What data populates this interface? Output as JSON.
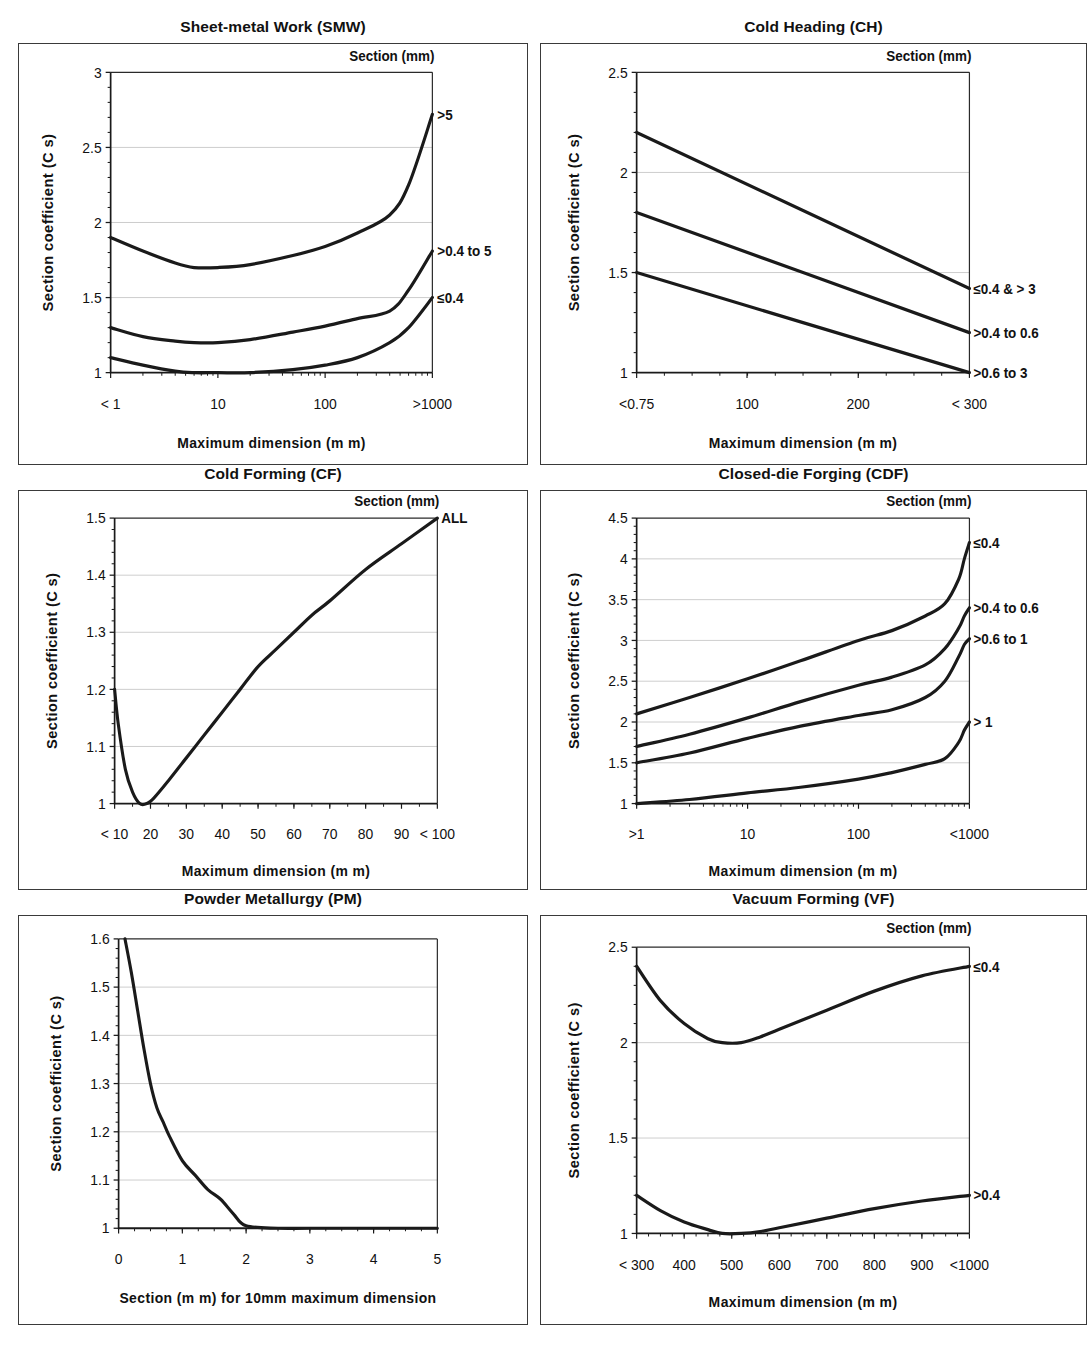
{
  "figure": {
    "panel_count": 6,
    "shared": {
      "ylabel": "Section coefficient (C s)",
      "xlabel_dimension": "Maximum dimension (m m)",
      "legend_heading": "Section (mm)"
    }
  },
  "chart_data": [
    {
      "id": "smw",
      "type": "line",
      "title": "Sheet-metal Work (SMW)",
      "xlabel": "Maximum dimension (m m)",
      "ylabel": "Section coefficient (C s)",
      "legend_title": "Section (mm)",
      "legend_position": "right-outside",
      "xscale": "log",
      "xlim": [
        1,
        1000
      ],
      "ylim": [
        1,
        3
      ],
      "yticks": [
        1,
        1.5,
        2,
        2.5,
        3
      ],
      "ytick_labels": [
        "1",
        "1.5",
        "2",
        "2.5",
        "3"
      ],
      "xticks": [
        1,
        10,
        100,
        1000
      ],
      "xtick_labels": [
        "< 1",
        "10",
        "100",
        ">1000"
      ],
      "grid": true,
      "series": [
        {
          "name": ">5",
          "x": [
            1,
            2,
            4,
            6,
            10,
            20,
            50,
            100,
            200,
            400,
            600,
            1000
          ],
          "values": [
            1.9,
            1.81,
            1.73,
            1.7,
            1.7,
            1.72,
            1.78,
            1.84,
            1.93,
            2.05,
            2.25,
            2.72
          ]
        },
        {
          "name": ">0.4 to 5",
          "x": [
            1,
            2,
            4,
            6,
            10,
            20,
            50,
            100,
            200,
            400,
            600,
            1000
          ],
          "values": [
            1.3,
            1.24,
            1.21,
            1.2,
            1.2,
            1.22,
            1.27,
            1.31,
            1.36,
            1.41,
            1.55,
            1.81
          ]
        },
        {
          "name": "≤0.4",
          "x": [
            1,
            2,
            4,
            6,
            10,
            20,
            50,
            100,
            200,
            400,
            600,
            1000
          ],
          "values": [
            1.1,
            1.05,
            1.01,
            1.0,
            1.0,
            1.0,
            1.02,
            1.05,
            1.1,
            1.2,
            1.3,
            1.5
          ]
        }
      ]
    },
    {
      "id": "ch",
      "type": "line",
      "title": "Cold Heading (CH)",
      "xlabel": "Maximum dimension (m m)",
      "ylabel": "Section coefficient (C s)",
      "legend_title": "Section (mm)",
      "legend_position": "right-outside",
      "xscale": "linear",
      "xlim": [
        0.75,
        300
      ],
      "ylim": [
        1,
        2.5
      ],
      "yticks": [
        1,
        1.5,
        2,
        2.5
      ],
      "ytick_labels": [
        "1",
        "1.5",
        "2",
        "2.5"
      ],
      "xticks": [
        0.75,
        100,
        200,
        300
      ],
      "xtick_labels": [
        "<0.75",
        "100",
        "200",
        "< 300"
      ],
      "grid": true,
      "series": [
        {
          "name": "≤0.4 & > 3",
          "x": [
            0.75,
            300
          ],
          "values": [
            2.2,
            1.42
          ]
        },
        {
          "name": ">0.4 to 0.6",
          "x": [
            0.75,
            300
          ],
          "values": [
            1.8,
            1.2
          ]
        },
        {
          "name": ">0.6 to 3",
          "x": [
            0.75,
            300
          ],
          "values": [
            1.5,
            1.0
          ]
        }
      ]
    },
    {
      "id": "cf",
      "type": "line",
      "title": "Cold Forming (CF)",
      "xlabel": "Maximum dimension (m m)",
      "ylabel": "Section coefficient (C s)",
      "legend_title": "Section (mm)",
      "legend_position": "right-outside",
      "xscale": "linear",
      "xlim": [
        10,
        100
      ],
      "ylim": [
        1,
        1.5
      ],
      "yticks": [
        1,
        1.1,
        1.2,
        1.3,
        1.4,
        1.5
      ],
      "ytick_labels": [
        "1",
        "1.1",
        "1.2",
        "1.3",
        "1.4",
        "1.5"
      ],
      "xticks": [
        10,
        20,
        30,
        40,
        50,
        60,
        70,
        80,
        90,
        100
      ],
      "xtick_labels": [
        "< 10",
        "20",
        "30",
        "40",
        "50",
        "60",
        "70",
        "80",
        "90",
        "< 100"
      ],
      "grid": true,
      "series": [
        {
          "name": "ALL",
          "x": [
            10,
            11,
            13,
            15,
            17,
            19,
            21,
            25,
            30,
            35,
            40,
            45,
            50,
            55,
            60,
            65,
            70,
            80,
            90,
            100
          ],
          "values": [
            1.2,
            1.14,
            1.06,
            1.02,
            1.0,
            1.0,
            1.01,
            1.04,
            1.08,
            1.12,
            1.16,
            1.2,
            1.24,
            1.27,
            1.3,
            1.33,
            1.355,
            1.41,
            1.455,
            1.5
          ]
        }
      ]
    },
    {
      "id": "cdf",
      "type": "line",
      "title": "Closed-die Forging (CDF)",
      "xlabel": "Maximum dimension (m m)",
      "ylabel": "Section coefficient (C s)",
      "legend_title": "Section (mm)",
      "legend_position": "right-outside",
      "xscale": "log",
      "xlim": [
        1,
        1000
      ],
      "ylim": [
        1,
        4.5
      ],
      "yticks": [
        1,
        1.5,
        2,
        2.5,
        3,
        3.5,
        4,
        4.5
      ],
      "ytick_labels": [
        "1",
        "1.5",
        "2",
        "2.5",
        "3",
        "3.5",
        "4",
        "4.5"
      ],
      "xticks": [
        1,
        10,
        100,
        1000
      ],
      "xtick_labels": [
        ">1",
        "10",
        "100",
        "<1000"
      ],
      "grid": true,
      "series": [
        {
          "name": "≤0.4",
          "x": [
            1,
            3,
            10,
            30,
            100,
            200,
            400,
            600,
            800,
            900,
            1000
          ],
          "values": [
            2.1,
            2.3,
            2.53,
            2.75,
            3.0,
            3.12,
            3.3,
            3.45,
            3.75,
            4.0,
            4.2
          ]
        },
        {
          "name": ">0.4 to 0.6",
          "x": [
            1,
            3,
            10,
            30,
            100,
            200,
            400,
            600,
            800,
            900,
            1000
          ],
          "values": [
            1.7,
            1.85,
            2.05,
            2.25,
            2.45,
            2.55,
            2.7,
            2.9,
            3.15,
            3.3,
            3.4
          ]
        },
        {
          "name": ">0.6 to 1",
          "x": [
            1,
            3,
            10,
            30,
            100,
            200,
            400,
            600,
            800,
            900,
            1000
          ],
          "values": [
            1.5,
            1.62,
            1.8,
            1.95,
            2.08,
            2.15,
            2.3,
            2.5,
            2.8,
            2.95,
            3.02
          ]
        },
        {
          "name": "> 1",
          "x": [
            1,
            3,
            10,
            30,
            100,
            200,
            400,
            600,
            800,
            900,
            1000
          ],
          "values": [
            1.0,
            1.05,
            1.13,
            1.2,
            1.3,
            1.38,
            1.48,
            1.55,
            1.75,
            1.9,
            2.0
          ]
        }
      ]
    },
    {
      "id": "pm",
      "type": "line",
      "title": "Powder Metallurgy (PM)",
      "xlabel": "Section (m m) for 10mm  maximum dimension",
      "ylabel": "Section coefficient (C s)",
      "legend_title": "",
      "legend_position": "none",
      "xscale": "linear",
      "xlim": [
        0,
        5
      ],
      "ylim": [
        1,
        1.6
      ],
      "yticks": [
        1,
        1.1,
        1.2,
        1.3,
        1.4,
        1.5,
        1.6
      ],
      "ytick_labels": [
        "1",
        "1.1",
        "1.2",
        "1.3",
        "1.4",
        "1.5",
        "1.6"
      ],
      "xticks": [
        0,
        1,
        2,
        3,
        4,
        5
      ],
      "xtick_labels": [
        "0",
        "1",
        "2",
        "3",
        "4",
        "5"
      ],
      "grid": true,
      "series": [
        {
          "name": "",
          "x": [
            0.1,
            0.2,
            0.3,
            0.4,
            0.5,
            0.6,
            0.7,
            0.8,
            1.0,
            1.2,
            1.4,
            1.6,
            1.8,
            2.0,
            2.5,
            3.0,
            4.0,
            5.0
          ],
          "values": [
            1.6,
            1.53,
            1.45,
            1.37,
            1.3,
            1.25,
            1.22,
            1.19,
            1.14,
            1.11,
            1.08,
            1.06,
            1.03,
            1.005,
            1.0,
            1.0,
            1.0,
            1.0
          ]
        }
      ]
    },
    {
      "id": "vf",
      "type": "line",
      "title": "Vacuum Forming (VF)",
      "xlabel": "Maximum dimension (m m)",
      "ylabel": "Section coefficient (C s)",
      "legend_title": "Section (mm)",
      "legend_position": "right-outside",
      "xscale": "linear",
      "xlim": [
        300,
        1000
      ],
      "ylim": [
        1,
        2.5
      ],
      "yticks": [
        1,
        1.5,
        2,
        2.5
      ],
      "ytick_labels": [
        "1",
        "1.5",
        "2",
        "2.5"
      ],
      "xticks": [
        300,
        400,
        500,
        600,
        700,
        800,
        900,
        1000
      ],
      "xtick_labels": [
        "< 300",
        "400",
        "500",
        "600",
        "700",
        "800",
        "900",
        "<1000"
      ],
      "grid": true,
      "series": [
        {
          "name": "≤0.4",
          "x": [
            300,
            350,
            400,
            450,
            480,
            520,
            560,
            600,
            700,
            800,
            900,
            1000
          ],
          "values": [
            2.4,
            2.22,
            2.1,
            2.02,
            2.0,
            2.0,
            2.03,
            2.07,
            2.17,
            2.27,
            2.35,
            2.4
          ]
        },
        {
          "name": ">0.4",
          "x": [
            300,
            350,
            400,
            450,
            480,
            520,
            560,
            600,
            700,
            800,
            900,
            1000
          ],
          "values": [
            1.2,
            1.12,
            1.06,
            1.02,
            1.0,
            1.0,
            1.01,
            1.03,
            1.08,
            1.13,
            1.17,
            1.2
          ]
        }
      ]
    }
  ]
}
